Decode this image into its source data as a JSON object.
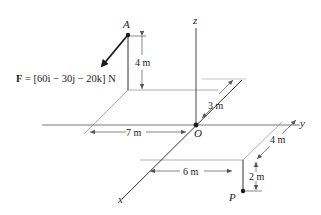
{
  "diagram": {
    "axes": {
      "x_label": "x",
      "y_label": "y",
      "z_label": "z",
      "origin_label": "O"
    },
    "points": {
      "A": {
        "label": "A"
      },
      "P": {
        "label": "P"
      }
    },
    "force": {
      "label_prefix": "F",
      "equation": " = [60i − 30j − 20k] N",
      "i_comp": "60",
      "j_comp": "30",
      "k_comp": "20",
      "unit": "N"
    },
    "dimensions": {
      "A_height": "4 m",
      "A_y_offset": "7 m",
      "A_x_offset": "3 m",
      "P_y_offset": "6 m",
      "P_x_offset": "4 m",
      "P_depth": "2 m"
    },
    "colors": {
      "ink": "#1a1a1a",
      "construction": "#9a9a9a"
    }
  }
}
